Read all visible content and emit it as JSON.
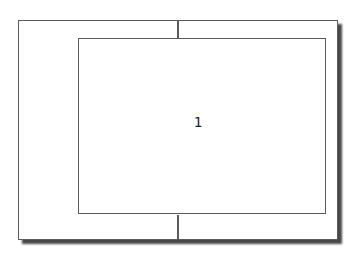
{
  "diagram": {
    "page_number": "1",
    "colors": {
      "background": "#ffffff",
      "line": "#5a5a5a",
      "shadow": "rgba(40,40,40,0.85)"
    }
  }
}
